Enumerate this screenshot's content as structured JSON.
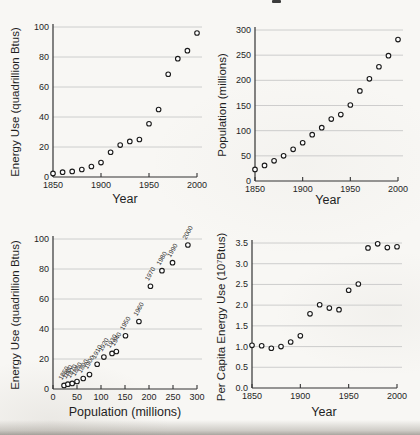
{
  "style": {
    "marker_fill": "#ffffff",
    "marker_edge": "#1a1a1a",
    "grid_color": "#c8c8c8",
    "axis_color": "#333333",
    "text_color": "#1f1f1f",
    "page_background": "#f8f7f4"
  },
  "chart_data": [
    {
      "id": "energy-vs-year",
      "type": "scatter",
      "title": "",
      "xlabel": "Year",
      "ylabel": "Energy Use (quadrillion Btus)",
      "xlim": [
        1850,
        2000
      ],
      "ylim": [
        0,
        100
      ],
      "xticks": [
        1850,
        1900,
        1950,
        2000
      ],
      "xtick_labels": [
        "1850",
        "1900",
        "1950",
        "2000"
      ],
      "yticks": [
        0,
        20,
        40,
        60,
        80,
        100
      ],
      "ytick_labels": [
        "0",
        "20",
        "40",
        "60",
        "80",
        "100"
      ],
      "grid": "horizontal-y",
      "legend": "none",
      "marker": "open-circle",
      "x": [
        1850,
        1860,
        1870,
        1880,
        1890,
        1900,
        1910,
        1920,
        1930,
        1940,
        1950,
        1960,
        1970,
        1980,
        1990,
        2000
      ],
      "y": [
        2.4,
        3.2,
        3.7,
        5,
        7,
        9.6,
        16.5,
        21.3,
        23.7,
        25,
        35.5,
        45,
        68.5,
        78.9,
        84.2,
        96
      ]
    },
    {
      "id": "population-vs-year",
      "type": "scatter",
      "title": "",
      "xlabel": "Year",
      "ylabel": "Population (millions)",
      "xlim": [
        1850,
        2000
      ],
      "ylim": [
        0,
        300
      ],
      "xticks": [
        1850,
        1900,
        1950,
        2000
      ],
      "xtick_labels": [
        "1850",
        "1900",
        "1950",
        "2000"
      ],
      "yticks": [
        0,
        50,
        100,
        150,
        200,
        250,
        300
      ],
      "ytick_labels": [
        "0",
        "50",
        "100",
        "150",
        "200",
        "250",
        "300"
      ],
      "grid": "horizontal-y",
      "legend": "none",
      "marker": "open-circle",
      "x": [
        1850,
        1860,
        1870,
        1880,
        1890,
        1900,
        1910,
        1920,
        1930,
        1940,
        1950,
        1960,
        1970,
        1980,
        1990,
        2000
      ],
      "y": [
        23,
        31,
        40,
        50,
        63,
        76,
        92,
        106,
        123,
        132,
        151,
        179,
        203,
        227,
        249,
        281
      ]
    },
    {
      "id": "energy-vs-population",
      "type": "scatter",
      "title": "",
      "xlabel": "Population (millions)",
      "ylabel": "Energy Use (quadrillion Btus)",
      "xlim": [
        0,
        300
      ],
      "ylim": [
        0,
        100
      ],
      "xticks": [
        0,
        50,
        100,
        150,
        200,
        250,
        300
      ],
      "xtick_labels": [
        "0",
        "50",
        "100",
        "150",
        "200",
        "250",
        "300"
      ],
      "yticks": [
        0,
        20,
        40,
        60,
        80,
        100
      ],
      "ytick_labels": [
        "0",
        "20",
        "40",
        "60",
        "80",
        "100"
      ],
      "grid": "horizontal-y",
      "legend": "none",
      "marker": "open-circle",
      "x": [
        23,
        31,
        40,
        50,
        63,
        76,
        92,
        106,
        123,
        132,
        151,
        179,
        203,
        227,
        249,
        281
      ],
      "y": [
        2.4,
        3.2,
        3.7,
        5,
        7,
        9.6,
        16.5,
        21.3,
        23.7,
        25,
        35.5,
        45,
        68.5,
        78.9,
        84.2,
        96
      ],
      "point_labels": [
        "1850",
        "1860",
        "1870",
        "1880",
        "1890",
        "1900",
        "1910",
        "1920",
        "1930",
        "1940",
        "1950",
        "1960",
        "1970",
        "1980",
        "1990",
        "2000"
      ]
    },
    {
      "id": "percapita-energy-vs-year",
      "type": "scatter",
      "title": "",
      "xlabel": "Year",
      "ylabel": "Per Capita Energy Use (10⁷Btus)",
      "xlim": [
        1850,
        2000
      ],
      "ylim": [
        0,
        3.5
      ],
      "xticks": [
        1850,
        1900,
        1950,
        2000
      ],
      "xtick_labels": [
        "1850",
        "1900",
        "1950",
        "2000"
      ],
      "yticks": [
        0,
        0.5,
        1,
        1.5,
        2,
        2.5,
        3,
        3.5
      ],
      "ytick_labels": [
        "0.0",
        "0.5",
        "1.0",
        "1.5",
        "2.0",
        "2.5",
        "3.0",
        "3.5"
      ],
      "grid": "horizontal-y",
      "legend": "none",
      "marker": "open-circle",
      "x": [
        1850,
        1860,
        1870,
        1880,
        1890,
        1900,
        1910,
        1920,
        1930,
        1940,
        1950,
        1960,
        1970,
        1980,
        1990,
        2000
      ],
      "y": [
        1.03,
        1.02,
        0.96,
        1.0,
        1.11,
        1.26,
        1.79,
        2.01,
        1.93,
        1.89,
        2.36,
        2.51,
        3.38,
        3.48,
        3.39,
        3.41
      ]
    }
  ]
}
